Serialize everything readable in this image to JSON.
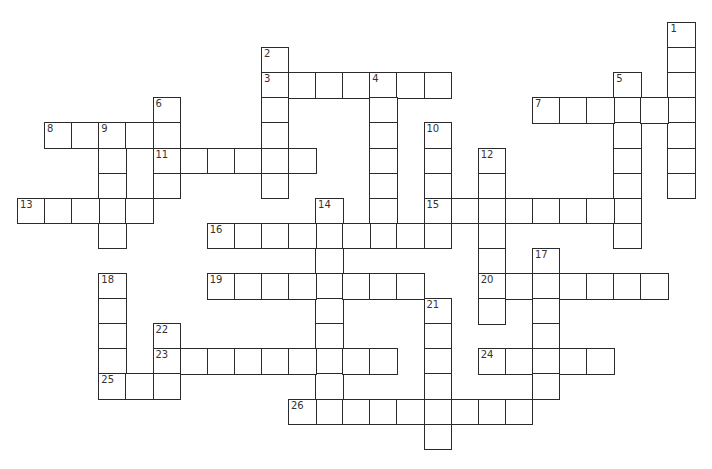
{
  "puzzle": {
    "type": "crossword",
    "grid_origin": {
      "x": 17,
      "y": 22
    },
    "cell_size": {
      "w": 27.1,
      "h": 25.1
    },
    "line_color": "#2b2b2b",
    "background": "#ffffff",
    "words": [
      {
        "number": 1,
        "direction": "down",
        "col": 24,
        "row": 0,
        "length": 7
      },
      {
        "number": 2,
        "direction": "down",
        "col": 9,
        "row": 1,
        "length": 6
      },
      {
        "number": 3,
        "direction": "across",
        "col": 9,
        "row": 2,
        "length": 7
      },
      {
        "number": 4,
        "direction": "down",
        "col": 13,
        "row": 2,
        "length": 7
      },
      {
        "number": 5,
        "direction": "down",
        "col": 22,
        "row": 2,
        "length": 7
      },
      {
        "number": 6,
        "direction": "down",
        "col": 5,
        "row": 3,
        "length": 4
      },
      {
        "number": 7,
        "direction": "across",
        "col": 19,
        "row": 3,
        "length": 6
      },
      {
        "number": 8,
        "direction": "across",
        "col": 1,
        "row": 4,
        "length": 5
      },
      {
        "number": 9,
        "direction": "down",
        "col": 3,
        "row": 4,
        "length": 5
      },
      {
        "number": 10,
        "direction": "down",
        "col": 15,
        "row": 4,
        "length": 5
      },
      {
        "number": 11,
        "direction": "across",
        "col": 5,
        "row": 5,
        "length": 6
      },
      {
        "number": 12,
        "direction": "down",
        "col": 17,
        "row": 5,
        "length": 7
      },
      {
        "number": 13,
        "direction": "across",
        "col": 0,
        "row": 7,
        "length": 5
      },
      {
        "number": 14,
        "direction": "down",
        "col": 11,
        "row": 7,
        "length": 9
      },
      {
        "number": 15,
        "direction": "across",
        "col": 15,
        "row": 7,
        "length": 8
      },
      {
        "number": 16,
        "direction": "across",
        "col": 7,
        "row": 8,
        "length": 9
      },
      {
        "number": 17,
        "direction": "down",
        "col": 19,
        "row": 9,
        "length": 6
      },
      {
        "number": 18,
        "direction": "down",
        "col": 3,
        "row": 10,
        "length": 5
      },
      {
        "number": 19,
        "direction": "across",
        "col": 7,
        "row": 10,
        "length": 8
      },
      {
        "number": 20,
        "direction": "across",
        "col": 17,
        "row": 10,
        "length": 7
      },
      {
        "number": 21,
        "direction": "down",
        "col": 15,
        "row": 11,
        "length": 6
      },
      {
        "number": 22,
        "direction": "down",
        "col": 5,
        "row": 12,
        "length": 3
      },
      {
        "number": 23,
        "direction": "across",
        "col": 5,
        "row": 13,
        "length": 9
      },
      {
        "number": 24,
        "direction": "across",
        "col": 17,
        "row": 13,
        "length": 5
      },
      {
        "number": 25,
        "direction": "across",
        "col": 3,
        "row": 14,
        "length": 3
      },
      {
        "number": 26,
        "direction": "across",
        "col": 10,
        "row": 15,
        "length": 9
      }
    ]
  }
}
